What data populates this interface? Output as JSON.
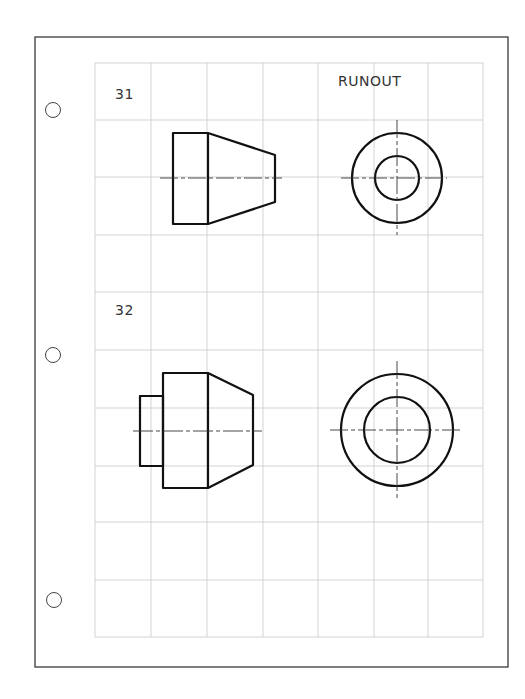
{
  "page": {
    "title": "RUNOUT",
    "colors": {
      "paper": "#ffffff",
      "border": "#3a3a3a",
      "grid": "#c8c8c8",
      "ink": "#111111"
    }
  },
  "problems": [
    {
      "number": "31",
      "front_view": "tapered-cylinder",
      "side_view": "two-concentric-circles"
    },
    {
      "number": "32",
      "front_view": "stepped-tapered-cylinder",
      "side_view": "two-concentric-circles"
    }
  ],
  "punch_holes": 3,
  "grid": {
    "columns": 7,
    "rows": 10
  }
}
